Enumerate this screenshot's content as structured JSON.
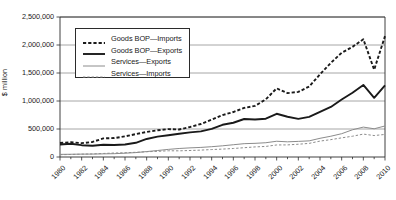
{
  "chart_data": {
    "type": "line",
    "title": "",
    "xlabel": "",
    "ylabel": "$ million",
    "ylim": [
      0,
      2500000
    ],
    "xlim": [
      1980,
      2010
    ],
    "grid": "horizontal",
    "legend_position": "top-left-inside",
    "ytick_labels": [
      "2,500,000",
      "2,000,000",
      "1,500,000",
      "1,000,000",
      "500,000",
      "0"
    ],
    "ytick_values": [
      2500000,
      2000000,
      1500000,
      1000000,
      500000,
      0
    ],
    "xtick_labels": [
      "1980",
      "1982",
      "1984",
      "1986",
      "1988",
      "1990",
      "1992",
      "1994",
      "1996",
      "1998",
      "2000",
      "2002",
      "2004",
      "2006",
      "2008",
      "2010"
    ],
    "xtick_values": [
      1980,
      1982,
      1984,
      1986,
      1988,
      1990,
      1992,
      1994,
      1996,
      1998,
      2000,
      2002,
      2004,
      2006,
      2008,
      2010
    ],
    "x": [
      1980,
      1981,
      1982,
      1983,
      1984,
      1985,
      1986,
      1987,
      1988,
      1989,
      1990,
      1991,
      1992,
      1993,
      1994,
      1995,
      1996,
      1997,
      1998,
      1999,
      2000,
      2001,
      2002,
      2003,
      2004,
      2005,
      2006,
      2007,
      2008,
      2009,
      2010
    ],
    "series": [
      {
        "name": "Goods BOP—Imports",
        "style": "dashed",
        "width": "thick",
        "color": "#1a1a1a",
        "values": [
          250000,
          265000,
          247000,
          269000,
          332000,
          338000,
          368000,
          409000,
          447000,
          477000,
          498000,
          491000,
          536000,
          589000,
          668000,
          749000,
          803000,
          876000,
          913000,
          1029000,
          1226000,
          1141000,
          1162000,
          1259000,
          1477000,
          1681000,
          1861000,
          1967000,
          2103000,
          1559000,
          2158000
        ]
      },
      {
        "name": "Goods BOP—Exports",
        "style": "solid",
        "width": "thick",
        "color": "#1a1a1a",
        "values": [
          224000,
          237000,
          211000,
          201000,
          219000,
          215000,
          224000,
          254000,
          322000,
          363000,
          389000,
          416000,
          440000,
          457000,
          502000,
          575000,
          612000,
          679000,
          670000,
          684000,
          772000,
          719000,
          682000,
          717000,
          807000,
          894000,
          1026000,
          1148000,
          1287000,
          1056000,
          1278000
        ]
      },
      {
        "name": "Services—Exports",
        "style": "solid",
        "width": "thin",
        "color": "#8c8c8c",
        "values": [
          47000,
          49000,
          51000,
          52000,
          56000,
          59000,
          68000,
          79000,
          97000,
          116000,
          136000,
          152000,
          163000,
          171000,
          184000,
          200000,
          219000,
          238000,
          244000,
          255000,
          281000,
          271000,
          279000,
          288000,
          334000,
          371000,
          416000,
          486000,
          534000,
          504000,
          554000
        ]
      },
      {
        "name": "Services—Imports",
        "style": "dashed",
        "width": "thin",
        "color": "#8c8c8c",
        "values": [
          41000,
          45000,
          51000,
          55000,
          63000,
          71000,
          76000,
          84000,
          94000,
          101000,
          111000,
          110000,
          116000,
          123000,
          133000,
          141000,
          152000,
          166000,
          180000,
          189000,
          215000,
          216000,
          228000,
          243000,
          284000,
          310000,
          342000,
          371000,
          409000,
          383000,
          403000
        ]
      }
    ]
  },
  "axis": {
    "ylabel": "$ million"
  },
  "legend": {
    "items": [
      {
        "label": "Goods BOP—Imports"
      },
      {
        "label": "Goods BOP—Exports"
      },
      {
        "label": "Services—Exports"
      },
      {
        "label": "Services—Imports"
      }
    ]
  }
}
